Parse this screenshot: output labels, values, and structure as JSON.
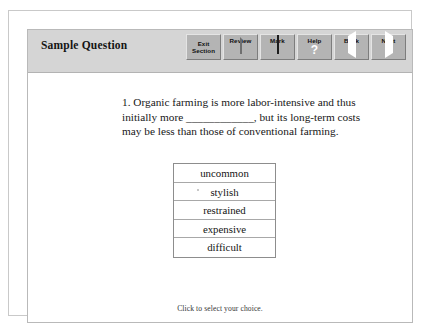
{
  "header": {
    "title": "Sample Question",
    "background_color": "#d5d5d5"
  },
  "toolbar": {
    "buttons": [
      {
        "label": "Exit\nSection",
        "icon": "none",
        "two_line": true
      },
      {
        "label": "Review",
        "icon": "page-icon",
        "two_line": false
      },
      {
        "label": "Mark",
        "icon": "checkbox-icon",
        "two_line": false
      },
      {
        "label": "Help",
        "icon": "question-mark-icon",
        "two_line": false
      },
      {
        "label": "Back",
        "icon": "triangle-left-icon",
        "two_line": false
      },
      {
        "label": "Next",
        "icon": "triangle-right-icon",
        "two_line": false
      }
    ]
  },
  "question": {
    "number": "1.",
    "text_before_blank": "1. Organic farming is more labor-intensive and thus initially more ",
    "blank": "____________",
    "text_after_blank": ", but its long-term costs may be less than those of conventional farming.",
    "full_text": "1. Organic farming is more labor-intensive and thus initially more ____________, but its long-term costs may be less than those of conventional farming."
  },
  "choices": [
    {
      "label": "uncommon",
      "selected": false
    },
    {
      "label": "stylish",
      "selected": false
    },
    {
      "label": "restrained",
      "selected": false
    },
    {
      "label": "expensive",
      "selected": false
    },
    {
      "label": "difficult",
      "selected": false
    }
  ],
  "footer": {
    "instruction": "Click to select your choice."
  }
}
